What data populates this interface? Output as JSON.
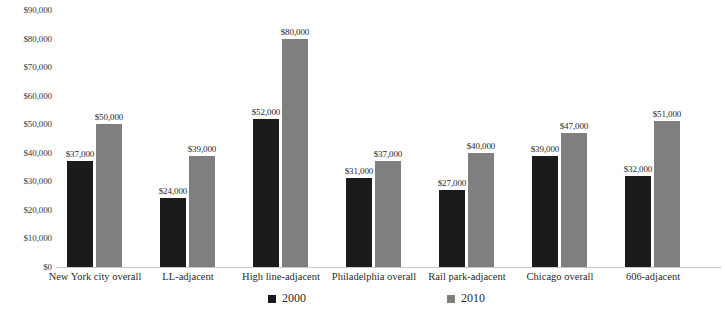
{
  "chart_data": {
    "type": "bar",
    "title": "",
    "subtitle": "",
    "xlabel": "",
    "ylabel": "",
    "ylim": [
      0,
      90000
    ],
    "y_tick_step": 10000,
    "grid": false,
    "legend_position": "bottom",
    "value_prefix": "$",
    "categories": [
      "New York city overall",
      "LL-adjacent",
      "High line-adjacent",
      "Philadelphia overall",
      "Rail park-adjacent",
      "Chicago overall",
      "606-adjacent"
    ],
    "y_ticks": [
      "$90,000",
      "$80,000",
      "$70,000",
      "$60,000",
      "$50,000",
      "$40,000",
      "$30,000",
      "$20,000",
      "$10,000",
      "$0"
    ],
    "series": [
      {
        "name": "2000",
        "color": "#1b1b1b",
        "values": [
          37000,
          24000,
          52000,
          31000,
          27000,
          39000,
          32000
        ],
        "labels": [
          "$37,000",
          "$24,000",
          "$52,000",
          "$31,000",
          "$27,000",
          "$39,000",
          "$32,000"
        ]
      },
      {
        "name": "2010",
        "color": "#7f7f7f",
        "values": [
          50000,
          39000,
          80000,
          37000,
          40000,
          47000,
          51000
        ],
        "labels": [
          "$50,000",
          "$39,000",
          "$80,000",
          "$37,000",
          "$40,000",
          "$47,000",
          "$51,000"
        ]
      }
    ]
  },
  "legend": {
    "items": [
      {
        "label": "2000",
        "color": "#1b1b1b"
      },
      {
        "label": "2010",
        "color": "#7f7f7f"
      }
    ]
  }
}
